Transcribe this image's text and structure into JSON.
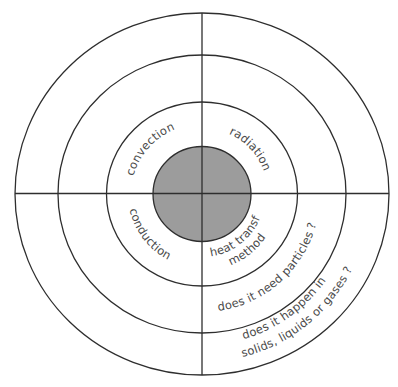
{
  "diagram": {
    "type": "concentric-quadrant-wheel",
    "center_hub": {
      "color": "#9c9c9c"
    },
    "colors": {
      "line": "#2e2e2e",
      "text": "#4a4a4a",
      "hub_fill": "#9c9c9c",
      "background": "#ffffff"
    },
    "rings": {
      "ring1_labels": {
        "top_left": "convection",
        "top_right": "radiation",
        "bottom_left": "conduction",
        "bottom_right_line1": "heat transfer",
        "bottom_right_line2": "method"
      },
      "ring2_labels": {
        "bottom_right": "does it need particles ?"
      },
      "ring3_labels": {
        "bottom_right_line1": "does it happen in",
        "bottom_right_line2": "solids, liquids or gases ?"
      }
    }
  }
}
